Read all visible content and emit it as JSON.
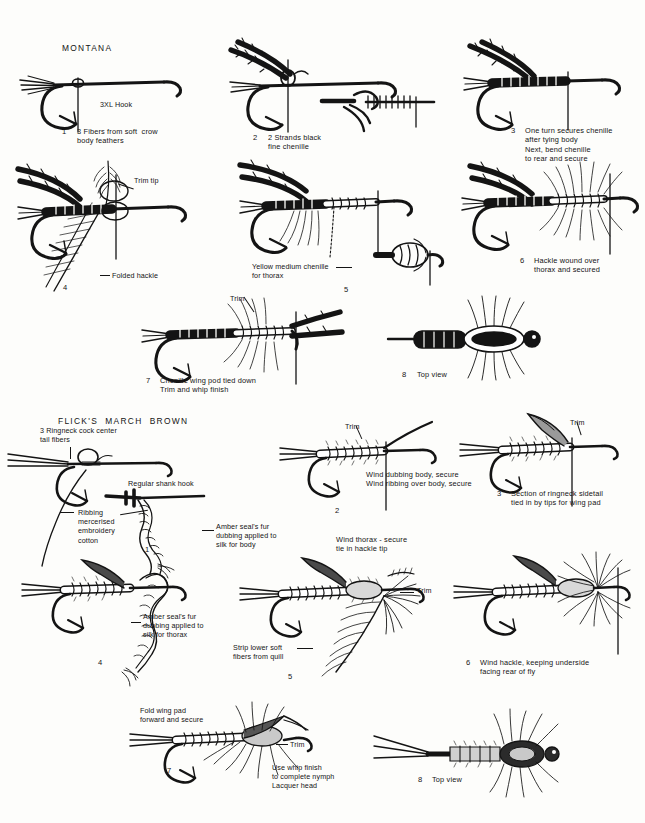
{
  "page": {
    "background_color": "#fdfdfb",
    "ink_color": "#141414",
    "width": 645,
    "height": 823
  },
  "sections": [
    {
      "id": "montana",
      "title": "MONTANA",
      "steps": [
        {
          "number": "1",
          "caption": "3 Fibers from soft  crow\nbody feathers",
          "labels": [
            "3XL Hook"
          ]
        },
        {
          "number": "2",
          "caption": "2 Strands black\nfine chenille",
          "labels": []
        },
        {
          "number": "3",
          "caption": "One turn secures chenille\nafter tying body\nNext, bend chenille\nto rear and secure",
          "labels": []
        },
        {
          "number": "4",
          "caption": "",
          "labels": [
            "Trim tip",
            "Folded hackle"
          ]
        },
        {
          "number": "5",
          "caption": "",
          "labels": [
            "Yellow medium chenille\nfor thorax"
          ]
        },
        {
          "number": "6",
          "caption": "Hackle wound over\nthorax and secured",
          "labels": []
        },
        {
          "number": "7",
          "caption": "Chenille wing pod tied down\nTrim and whip finish",
          "labels": [
            "Trim"
          ]
        },
        {
          "number": "8",
          "caption": "Top view",
          "labels": []
        }
      ]
    },
    {
      "id": "flicks-march-brown",
      "title": "FLICK'S  MARCH  BROWN",
      "steps": [
        {
          "number": "1",
          "caption": "",
          "labels": [
            "3 Ringneck cock center\ntail fibers",
            "Regular shank hook",
            "Ribbing\nmercerised\nembroidery\ncotton",
            "Amber seal's fur\ndubbing applied to\nsilk for body"
          ]
        },
        {
          "number": "2",
          "caption": "Wind dubbing body, secure\nWind ribbing over body, secure",
          "labels": [
            "Trim",
            "Wind thorax - secure\ntie in hackle tip"
          ]
        },
        {
          "number": "3",
          "caption": "Section of ringneck sidetail\ntied in by tips for wing pad",
          "labels": [
            "Trim"
          ]
        },
        {
          "number": "4",
          "caption": "",
          "labels": [
            "Amber seal's fur\ndubbing applied to\nsilk for thorax"
          ]
        },
        {
          "number": "5",
          "caption": "",
          "labels": [
            "Trim",
            "Strip lower soft\nfibers from quill"
          ]
        },
        {
          "number": "6",
          "caption": "Wind hackle, keeping underside\nfacing rear of fly",
          "labels": []
        },
        {
          "number": "7",
          "caption": "",
          "labels": [
            "Fold wing pad\nforward and secure",
            "Trim",
            "Use whip finish\nto complete nymph\nLacquer head"
          ]
        },
        {
          "number": "8",
          "caption": "Top view",
          "labels": []
        }
      ]
    }
  ]
}
